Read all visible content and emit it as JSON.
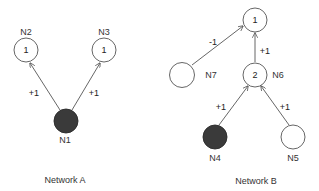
{
  "colors": {
    "background": "#ffffff",
    "node_stroke": "#555555",
    "node_filled": "#3a3a3a",
    "edge": "#555555",
    "text": "#333333"
  },
  "networkA": {
    "caption": "Network A",
    "nodes": [
      {
        "id": "N1",
        "label": "N1",
        "value": "",
        "filled": true
      },
      {
        "id": "N2",
        "label": "N2",
        "value": "1",
        "filled": false
      },
      {
        "id": "N3",
        "label": "N3",
        "value": "1",
        "filled": false
      }
    ],
    "edges": [
      {
        "from": "N1",
        "to": "N2",
        "weight": "+1"
      },
      {
        "from": "N1",
        "to": "N3",
        "weight": "+1"
      }
    ]
  },
  "networkB": {
    "caption": "Network B",
    "nodes": [
      {
        "id": "top",
        "label": "",
        "value": "1",
        "filled": false
      },
      {
        "id": "N7",
        "label": "N7",
        "value": "",
        "filled": false
      },
      {
        "id": "N6",
        "label": "N6",
        "value": "2",
        "filled": false
      },
      {
        "id": "N4",
        "label": "N4",
        "value": "",
        "filled": true
      },
      {
        "id": "N5",
        "label": "N5",
        "value": "",
        "filled": false
      }
    ],
    "edges": [
      {
        "from": "N7",
        "to": "top",
        "weight": "-1"
      },
      {
        "from": "N6",
        "to": "top",
        "weight": "+1"
      },
      {
        "from": "N4",
        "to": "N6",
        "weight": "+1"
      },
      {
        "from": "N5",
        "to": "N6",
        "weight": "+1"
      }
    ]
  }
}
